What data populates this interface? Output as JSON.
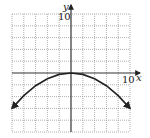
{
  "chart_data": {
    "type": "line",
    "title": "",
    "xlabel": "x",
    "ylabel": "y",
    "x_tick_label": "10",
    "y_tick_label": "10",
    "xlim": [
      -10,
      10
    ],
    "ylim": [
      -10,
      10
    ],
    "grid": true,
    "grid_step": 2,
    "series": [
      {
        "name": "parabola opening downward",
        "equation_estimate": "y = -0.06x^2",
        "x": [
          -10,
          -8,
          -6,
          -4,
          -2,
          0,
          2,
          4,
          6,
          8,
          10
        ],
        "y": [
          -6,
          -3.84,
          -2.16,
          -0.96,
          -0.24,
          0,
          -0.24,
          -0.96,
          -2.16,
          -3.84,
          -6
        ],
        "arrows_at_ends": true
      }
    ]
  },
  "labels": {
    "x_axis": "x",
    "y_axis": "y",
    "x_max": "10",
    "y_max": "10"
  }
}
